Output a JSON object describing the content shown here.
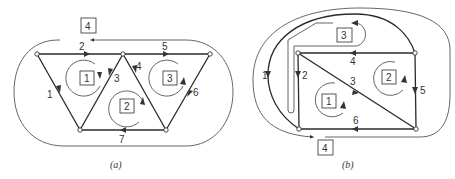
{
  "figures": [
    {
      "id": "a",
      "caption": "(a)",
      "edges": [
        {
          "label": "1"
        },
        {
          "label": "2"
        },
        {
          "label": "3"
        },
        {
          "label": "4"
        },
        {
          "label": "5"
        },
        {
          "label": "6"
        },
        {
          "label": "7"
        }
      ],
      "meshes": [
        {
          "label": "1"
        },
        {
          "label": "2"
        },
        {
          "label": "3"
        },
        {
          "label": "4"
        }
      ]
    },
    {
      "id": "b",
      "caption": "(b)",
      "edges": [
        {
          "label": "1"
        },
        {
          "label": "2"
        },
        {
          "label": "3"
        },
        {
          "label": "4"
        },
        {
          "label": "5"
        },
        {
          "label": "6"
        }
      ],
      "meshes": [
        {
          "label": "1"
        },
        {
          "label": "2"
        },
        {
          "label": "3"
        },
        {
          "label": "4"
        }
      ]
    }
  ]
}
